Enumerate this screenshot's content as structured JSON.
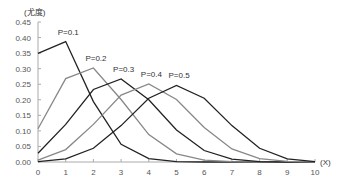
{
  "chart_data": {
    "type": "line",
    "title": "",
    "xlabel": "(X)",
    "ylabel": "(尤度)",
    "x": [
      0,
      1,
      2,
      3,
      4,
      5,
      6,
      7,
      8,
      9,
      10
    ],
    "xticks": [
      "0",
      "1",
      "2",
      "3",
      "4",
      "5",
      "6",
      "7",
      "8",
      "9",
      "10"
    ],
    "yticks": [
      "0.00",
      "0.05",
      "0.10",
      "0.15",
      "0.20",
      "0.25",
      "0.30",
      "0.35",
      "0.40",
      "0.45"
    ],
    "xlim": [
      0,
      10
    ],
    "ylim": [
      0,
      0.45
    ],
    "grid": false,
    "legend": "inline labels",
    "series": [
      {
        "name": "P=0.1",
        "color": "#222222",
        "label_pos": [
          1,
          0.39
        ],
        "values": [
          0.349,
          0.387,
          0.194,
          0.057,
          0.011,
          0.001,
          0.0,
          0.0,
          0.0,
          0.0,
          0.0
        ]
      },
      {
        "name": "P=0.2",
        "color": "#888888",
        "label_pos": [
          2,
          0.305
        ],
        "values": [
          0.107,
          0.268,
          0.302,
          0.201,
          0.088,
          0.026,
          0.006,
          0.001,
          0.0,
          0.0,
          0.0
        ]
      },
      {
        "name": "P=0.3",
        "color": "#222222",
        "label_pos": [
          3,
          0.27
        ],
        "values": [
          0.028,
          0.121,
          0.233,
          0.267,
          0.2,
          0.103,
          0.037,
          0.009,
          0.001,
          0.0,
          0.0
        ]
      },
      {
        "name": "P=0.4",
        "color": "#888888",
        "label_pos": [
          4,
          0.255
        ],
        "values": [
          0.006,
          0.04,
          0.121,
          0.215,
          0.251,
          0.201,
          0.111,
          0.042,
          0.011,
          0.002,
          0.0
        ]
      },
      {
        "name": "P=0.5",
        "color": "#222222",
        "label_pos": [
          5,
          0.25
        ],
        "values": [
          0.001,
          0.01,
          0.044,
          0.117,
          0.205,
          0.246,
          0.205,
          0.117,
          0.044,
          0.01,
          0.001
        ]
      }
    ]
  }
}
